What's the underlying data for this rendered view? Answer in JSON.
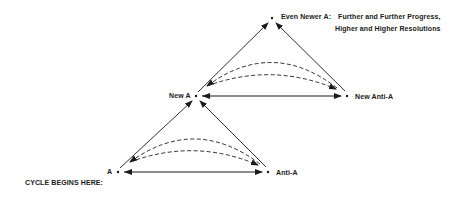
{
  "diagram": {
    "start_label": "CYCLE BEGINS HERE:",
    "nodes": {
      "a": "A",
      "anti_a": "Anti-A",
      "new_a": "New A",
      "new_anti_a": "New Anti-A",
      "even_newer_a": "Even Newer A:"
    },
    "annotation": {
      "line1": "Further and Further Progress,",
      "line2": "Higher and Higher Resolutions"
    },
    "colors": {
      "stroke": "#1a1a1a",
      "background": "#ffffff"
    }
  }
}
